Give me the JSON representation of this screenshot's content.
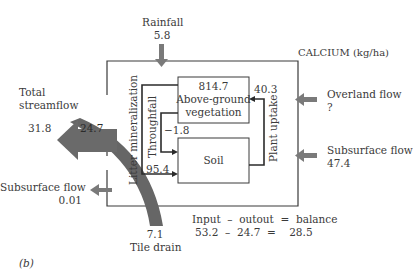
{
  "diagram": {
    "title": "CALCIUM (kg/ha)",
    "panel_label": "(b)",
    "colors": {
      "arrow_gray": "#7a7a7a",
      "line_dark": "#2b2b2b",
      "text": "#3a3a3a"
    },
    "inputs": {
      "rainfall": {
        "label": "Rainfall",
        "value": "5.8"
      },
      "overland_flow": {
        "label": "Overland flow",
        "value": "?"
      },
      "subsurface_flow_in": {
        "label": "Subsurface flow",
        "value": "47.4"
      }
    },
    "outputs": {
      "total_streamflow": {
        "label_line1": "Total",
        "label_line2": "streamflow",
        "value": "31.8",
        "arrow_value": "24.7"
      },
      "subsurface_flow_out": {
        "label": "Subsurface flow",
        "value": "0.01"
      },
      "tile_drain": {
        "label": "Tile drain",
        "value": "7.1"
      }
    },
    "pools": {
      "vegetation": {
        "value": "814.7",
        "label_line1": "Above-ground",
        "label_line2": "vegetation"
      },
      "soil": {
        "label": "Soil"
      }
    },
    "fluxes": {
      "litter_mineralization": {
        "label": "Litter mineralization",
        "value": "95.4"
      },
      "throughfall": {
        "label": "Throughfall",
        "value": "−1.8"
      },
      "plant_uptake": {
        "label": "Plant uptake",
        "value": "40.3"
      }
    },
    "balance": {
      "header": "Input  –  outout  =  balance",
      "equation": "53.2  –  24.7  =    28.5"
    }
  }
}
